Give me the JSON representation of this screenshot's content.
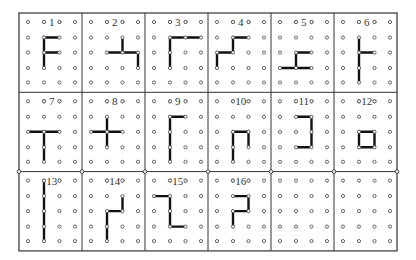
{
  "board": {
    "origin": [
      19,
      13
    ],
    "cell_width": 63,
    "cell_height": 79.3,
    "columns": 6,
    "rows": 3,
    "dot_x_offsets": [
      9,
      25,
      40.5,
      56
    ],
    "dot_y_offsets": [
      9,
      24.5,
      39.5,
      55,
      69.5
    ],
    "dot_radius": 1.6,
    "line_color": "#333333",
    "segment_color": "#111111",
    "dot_color": "#555555",
    "junction_circles_row_divider": 2
  },
  "cells": [
    {
      "label": "1",
      "segments": [
        [
          [
            1,
            1
          ],
          [
            1,
            3
          ]
        ],
        [
          [
            1,
            1
          ],
          [
            2,
            1
          ]
        ],
        [
          [
            1,
            2
          ],
          [
            2,
            2
          ]
        ]
      ]
    },
    {
      "label": "2",
      "segments": [
        [
          [
            2,
            1
          ],
          [
            2,
            2
          ]
        ],
        [
          [
            1,
            2
          ],
          [
            3,
            2
          ]
        ],
        [
          [
            3,
            2
          ],
          [
            3,
            3
          ]
        ]
      ]
    },
    {
      "label": "3",
      "segments": [
        [
          [
            1,
            1
          ],
          [
            3,
            1
          ]
        ],
        [
          [
            1,
            1
          ],
          [
            1,
            3
          ]
        ]
      ]
    },
    {
      "label": "4",
      "segments": [
        [
          [
            1,
            1
          ],
          [
            2,
            1
          ]
        ],
        [
          [
            1,
            1
          ],
          [
            1,
            2
          ]
        ],
        [
          [
            0,
            2
          ],
          [
            1,
            2
          ]
        ],
        [
          [
            0,
            2
          ],
          [
            0,
            3
          ]
        ]
      ]
    },
    {
      "label": "5",
      "segments": [
        [
          [
            1,
            2
          ],
          [
            2,
            2
          ]
        ],
        [
          [
            1,
            2
          ],
          [
            1,
            3
          ]
        ],
        [
          [
            0,
            3
          ],
          [
            2,
            3
          ]
        ]
      ]
    },
    {
      "label": "6",
      "segments": [
        [
          [
            1,
            1
          ],
          [
            1,
            4
          ]
        ],
        [
          [
            1,
            2
          ],
          [
            2,
            2
          ]
        ]
      ]
    },
    {
      "label": "7",
      "segments": [
        [
          [
            0,
            2
          ],
          [
            2,
            2
          ]
        ],
        [
          [
            1,
            2
          ],
          [
            1,
            4
          ]
        ]
      ]
    },
    {
      "label": "8",
      "segments": [
        [
          [
            1,
            1
          ],
          [
            1,
            3
          ]
        ],
        [
          [
            0,
            2
          ],
          [
            2,
            2
          ]
        ]
      ]
    },
    {
      "label": "9",
      "segments": [
        [
          [
            1,
            1
          ],
          [
            2,
            1
          ]
        ],
        [
          [
            1,
            1
          ],
          [
            1,
            4
          ]
        ]
      ]
    },
    {
      "label": "10",
      "segments": [
        [
          [
            1,
            2
          ],
          [
            2,
            2
          ]
        ],
        [
          [
            1,
            2
          ],
          [
            1,
            4
          ]
        ],
        [
          [
            2,
            2
          ],
          [
            2,
            3
          ]
        ]
      ]
    },
    {
      "label": "11",
      "segments": [
        [
          [
            1,
            1
          ],
          [
            2,
            1
          ]
        ],
        [
          [
            2,
            1
          ],
          [
            2,
            3
          ]
        ],
        [
          [
            1,
            3
          ],
          [
            2,
            3
          ]
        ]
      ]
    },
    {
      "label": "12",
      "segments": [
        [
          [
            1,
            2
          ],
          [
            2,
            2
          ]
        ],
        [
          [
            2,
            2
          ],
          [
            2,
            3
          ]
        ],
        [
          [
            1,
            3
          ],
          [
            2,
            3
          ]
        ],
        [
          [
            1,
            2
          ],
          [
            1,
            3
          ]
        ]
      ]
    },
    {
      "label": "13",
      "segments": [
        [
          [
            1,
            0
          ],
          [
            1,
            4
          ]
        ]
      ]
    },
    {
      "label": "14",
      "segments": [
        [
          [
            2,
            1
          ],
          [
            2,
            2
          ]
        ],
        [
          [
            1,
            2
          ],
          [
            2,
            2
          ]
        ],
        [
          [
            1,
            2
          ],
          [
            1,
            4
          ]
        ]
      ]
    },
    {
      "label": "15",
      "segments": [
        [
          [
            0,
            1
          ],
          [
            1,
            1
          ]
        ],
        [
          [
            1,
            1
          ],
          [
            1,
            3
          ]
        ],
        [
          [
            1,
            3
          ],
          [
            2,
            3
          ]
        ]
      ]
    },
    {
      "label": "16",
      "segments": [
        [
          [
            1,
            1
          ],
          [
            2,
            1
          ]
        ],
        [
          [
            2,
            1
          ],
          [
            2,
            2
          ]
        ],
        [
          [
            1,
            2
          ],
          [
            2,
            2
          ]
        ],
        [
          [
            1,
            2
          ],
          [
            1,
            3
          ]
        ]
      ]
    },
    {
      "label": "",
      "segments": []
    },
    {
      "label": "",
      "segments": []
    }
  ]
}
